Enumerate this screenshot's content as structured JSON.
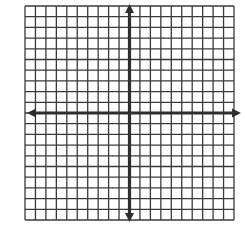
{
  "diagram": {
    "type": "coordinate-plane",
    "grid": {
      "columns": 20,
      "rows": 20,
      "left": 25,
      "top": 6,
      "right": 234,
      "bottom": 220,
      "line_color": "#3a3a3a",
      "line_width": 1.3
    },
    "axes": {
      "color": "#2e2e2e",
      "width": 3.2,
      "x_axis_row": 10,
      "y_axis_col": 10,
      "arrows": [
        "left",
        "right",
        "up",
        "down"
      ],
      "x_extent": [
        27,
        241
      ],
      "y_extent": [
        4,
        222
      ]
    },
    "colors": {
      "background": "#ffffff",
      "grid": "#3a3a3a",
      "axis": "#2e2e2e"
    }
  }
}
